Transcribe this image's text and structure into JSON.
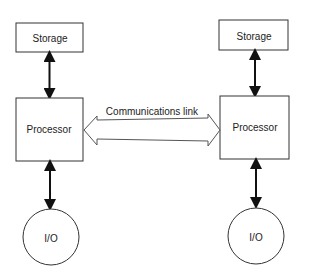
{
  "diagram": {
    "left_node": {
      "storage_label": "Storage",
      "processor_label": "Processor",
      "io_label": "I/O"
    },
    "right_node": {
      "storage_label": "Storage",
      "processor_label": "Processor",
      "io_label": "I/O"
    },
    "link_label": "Communications link"
  }
}
